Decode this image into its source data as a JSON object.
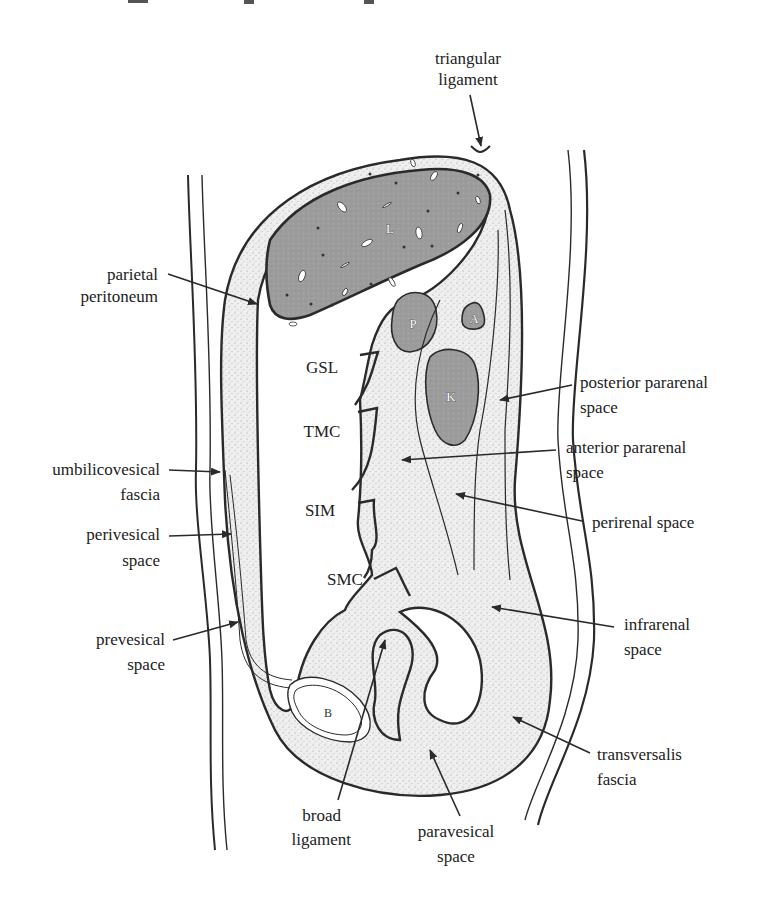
{
  "figure": {
    "type": "anatomical sagittal diagram",
    "colors": {
      "stroke": "#2a2a2a",
      "organ_fill": "#9a9a9a",
      "stipple_fill": "#e8e8e8",
      "background": "#ffffff"
    },
    "organs": {
      "liver": "L",
      "pancreas": "P",
      "adrenal": "A",
      "kidney": "K",
      "bladder": "B"
    },
    "mesentery_labels": {
      "gsl": "GSL",
      "tmc": "TMC",
      "sim": "SIM",
      "smc": "SMC"
    },
    "labels": {
      "triangular_ligament": [
        "triangular",
        "ligament"
      ],
      "parietal_peritoneum": [
        "parietal",
        "peritoneum"
      ],
      "posterior_pararenal": [
        "posterior pararenal",
        "space"
      ],
      "anterior_pararenal": [
        "anterior pararenal",
        "space"
      ],
      "umbilicovesical_fascia": [
        "umbilicovesical",
        "fascia"
      ],
      "perirenal_space": [
        "perirenal space"
      ],
      "perivesical_space": [
        "perivesical",
        "space"
      ],
      "prevesical_space": [
        "prevesical",
        "space"
      ],
      "infrarenal_space": [
        "infrarenal",
        "space"
      ],
      "transversalis_fascia": [
        "transversalis",
        "fascia"
      ],
      "broad_ligament": [
        "broad",
        "ligament"
      ],
      "paravesical_space": [
        "paravesical",
        "space"
      ]
    }
  }
}
